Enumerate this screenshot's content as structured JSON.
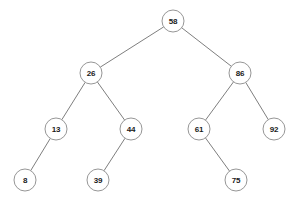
{
  "diagram": {
    "type": "binary-search-tree",
    "background_color": "#ffffff",
    "node_fill_color": "#ffffff",
    "node_stroke_color": "#8a8a8a",
    "edge_color": "#6f6f6f",
    "label_color": "#1a1a1a",
    "node_radius": 11
  },
  "nodes": [
    {
      "id": "n58",
      "label": "58",
      "x": 173,
      "y": 21,
      "depth": 0
    },
    {
      "id": "n26",
      "label": "26",
      "x": 91,
      "y": 73,
      "depth": 1
    },
    {
      "id": "n86",
      "label": "86",
      "x": 240,
      "y": 73,
      "depth": 1
    },
    {
      "id": "n13",
      "label": "13",
      "x": 56,
      "y": 129,
      "depth": 2
    },
    {
      "id": "n44",
      "label": "44",
      "x": 131,
      "y": 129,
      "depth": 2
    },
    {
      "id": "n61",
      "label": "61",
      "x": 199,
      "y": 129,
      "depth": 2
    },
    {
      "id": "n92",
      "label": "92",
      "x": 274,
      "y": 129,
      "depth": 2
    },
    {
      "id": "n8",
      "label": "8",
      "x": 25,
      "y": 180,
      "depth": 3
    },
    {
      "id": "n39",
      "label": "39",
      "x": 98,
      "y": 180,
      "depth": 3
    },
    {
      "id": "n75",
      "label": "75",
      "x": 236,
      "y": 180,
      "depth": 3
    }
  ],
  "edges": [
    {
      "from": "n58",
      "to": "n26",
      "side": "left"
    },
    {
      "from": "n58",
      "to": "n86",
      "side": "right"
    },
    {
      "from": "n26",
      "to": "n13",
      "side": "left"
    },
    {
      "from": "n26",
      "to": "n44",
      "side": "right"
    },
    {
      "from": "n13",
      "to": "n8",
      "side": "left"
    },
    {
      "from": "n44",
      "to": "n39",
      "side": "left"
    },
    {
      "from": "n86",
      "to": "n61",
      "side": "left"
    },
    {
      "from": "n86",
      "to": "n92",
      "side": "right"
    },
    {
      "from": "n61",
      "to": "n75",
      "side": "right"
    }
  ]
}
